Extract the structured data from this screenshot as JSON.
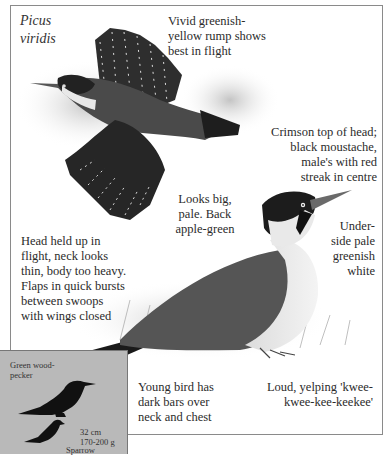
{
  "species_name": "Picus\nviridis",
  "species_line1": "Picus",
  "species_line2": "viridis",
  "annotations": {
    "rump": [
      "Vivid greenish-",
      "yellow rump shows",
      "best in flight"
    ],
    "head": [
      "Crimson top of head;",
      "black moustache,",
      "male's with red",
      "streak in centre"
    ],
    "back": [
      "Looks big,",
      "pale. Back",
      "apple-green"
    ],
    "underside": [
      "Under-",
      "side pale",
      "greenish",
      "white"
    ],
    "flight": [
      "Head held up in",
      "flight, neck looks",
      "thin, body too heavy.",
      "Flaps in quick bursts",
      "between swoops",
      "with wings closed"
    ],
    "young": [
      "Young bird has",
      "dark bars over",
      "neck and chest"
    ],
    "call": [
      "Loud, yelping 'kwee-",
      "kwee-kee-keekee'"
    ]
  },
  "size_inset": {
    "bird_label": [
      "Green wood-",
      "pecker"
    ],
    "size": "32 cm",
    "weight": "170-200 g",
    "comparison_label": "Sparrow"
  },
  "colors": {
    "frame_border": "#8a8a8a",
    "inset_bg": "#b9b9b9",
    "silhouette": "#111111",
    "text": "#2b2b2b"
  }
}
